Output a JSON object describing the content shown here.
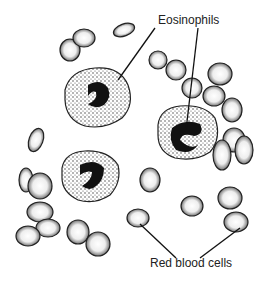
{
  "diagram": {
    "labels": {
      "eosinophils": "Eosinophils",
      "red_blood_cells": "Red blood cells"
    },
    "colors": {
      "ink": "#1a1a1a",
      "background": "#ffffff"
    }
  }
}
